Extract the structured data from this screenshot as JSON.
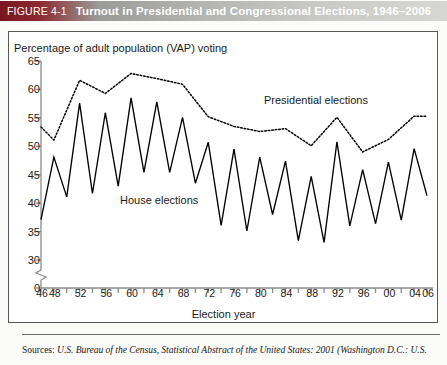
{
  "header": {
    "figure_number": "FIGURE 4-1",
    "title": "Turnout in Presidential and Congressional Elections, 1946–2006",
    "bar_color_left": "#7b1520",
    "bar_color_right": "#d6d6d3",
    "text_color": "#ffffff"
  },
  "footer": {
    "source_lead": "Sources:",
    "source_text": "U.S. Bureau of the Census, Statistical Abstract of the United States: 2001 (Washington D.C.: U.S."
  },
  "chart_data": {
    "type": "line",
    "title": "Turnout in Presidential and Congressional Elections, 1946–2006",
    "xlabel": "Election year",
    "ylabel": "Percentage of adult population (VAP) voting",
    "ylim": [
      30,
      65
    ],
    "yticks": [
      65,
      60,
      55,
      50,
      45,
      40,
      35,
      30,
      0
    ],
    "y_axis_break": true,
    "xlim": [
      1946,
      2006
    ],
    "xticks": [
      1946,
      1948,
      1950,
      1952,
      1954,
      1956,
      1958,
      1960,
      1962,
      1964,
      1966,
      1968,
      1970,
      1972,
      1974,
      1976,
      1978,
      1980,
      1982,
      1984,
      1986,
      1988,
      1990,
      1992,
      1994,
      1996,
      1998,
      2000,
      2002,
      2004,
      2006
    ],
    "xticklabels": [
      "46",
      "48",
      "",
      "52",
      "",
      "56",
      "",
      "60",
      "",
      "64",
      "",
      "68",
      "",
      "72",
      "",
      "76",
      "",
      "80",
      "",
      "84",
      "",
      "88",
      "",
      "92",
      "",
      "96",
      "",
      "00",
      "",
      "04",
      "06"
    ],
    "grid": false,
    "legend_position": "inline-annotation",
    "series": [
      {
        "name": "House elections",
        "style": "solid",
        "color": "#000000",
        "x": [
          1946,
          1948,
          1950,
          1952,
          1954,
          1956,
          1958,
          1960,
          1962,
          1964,
          1966,
          1968,
          1970,
          1972,
          1974,
          1976,
          1978,
          1980,
          1982,
          1984,
          1986,
          1988,
          1990,
          1992,
          1994,
          1996,
          1998,
          2000,
          2002,
          2004,
          2006
        ],
        "values": [
          37.1,
          48.1,
          41.1,
          57.6,
          41.7,
          55.9,
          43.0,
          58.5,
          45.4,
          57.8,
          45.4,
          55.1,
          43.5,
          50.7,
          36.1,
          49.5,
          35.1,
          48.1,
          38.0,
          47.4,
          33.4,
          44.7,
          33.1,
          50.8,
          36.0,
          45.9,
          36.4,
          47.2,
          37.0,
          49.6,
          41.3
        ]
      },
      {
        "name": "Presidential elections",
        "style": "dotted",
        "color": "#000000",
        "x": [
          1946,
          1948,
          1952,
          1956,
          1960,
          1964,
          1968,
          1972,
          1976,
          1980,
          1984,
          1988,
          1992,
          1996,
          2000,
          2004,
          2006
        ],
        "values": [
          53.4,
          51.1,
          61.6,
          59.3,
          62.8,
          61.9,
          60.9,
          55.2,
          53.5,
          52.6,
          53.1,
          50.1,
          55.1,
          49.0,
          51.2,
          55.3,
          55.3
        ]
      }
    ],
    "annotations": [
      {
        "text": "Presidential elections",
        "x": 1984,
        "y": 58
      },
      {
        "text": "House elections",
        "x": 1966,
        "y": 39.5
      }
    ]
  }
}
